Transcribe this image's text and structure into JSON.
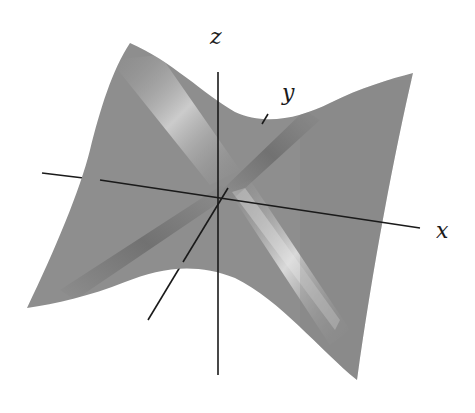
{
  "figure": {
    "type": "3d-surface",
    "colors": {
      "surface_base": "#8e8e8e",
      "surface_highlight": "#d8d8d8",
      "surface_shadow": "#6c6c6c",
      "axis": "#1a1a1a",
      "background": "#ffffff"
    }
  },
  "axes": {
    "x": {
      "label": "x"
    },
    "y": {
      "label": "y"
    },
    "z": {
      "label": "z"
    }
  }
}
